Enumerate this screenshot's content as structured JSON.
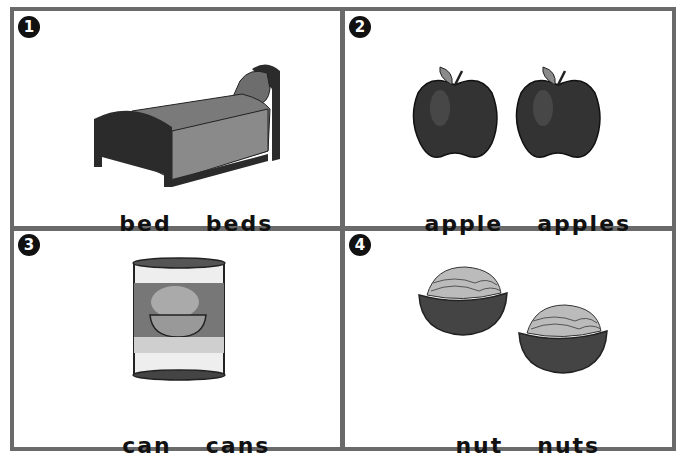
{
  "cards": [
    {
      "number": "1",
      "singular": "bed",
      "plural": "beds",
      "image": "bed-icon"
    },
    {
      "number": "2",
      "singular": "apple",
      "plural": "apples",
      "image": "apple-icon"
    },
    {
      "number": "3",
      "singular": "can",
      "plural": "cans",
      "image": "can-icon"
    },
    {
      "number": "4",
      "singular": "nut",
      "plural": "nuts",
      "image": "nut-icon"
    }
  ],
  "colors": {
    "border": "#6a6a6a",
    "badge": "#111111"
  }
}
